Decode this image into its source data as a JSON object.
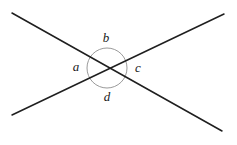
{
  "figure": {
    "name": "intersecting-lines-angle-diagram",
    "width": 237,
    "height": 145,
    "background_color": "#ffffff",
    "line_color": "#1f1f1f",
    "circle_color": "#9a9a9a",
    "label_color": "#1a1a1a",
    "line_width": 1.5,
    "circle_width": 1,
    "intersection": {
      "x": 107,
      "y": 68
    },
    "circle": {
      "cx": 107,
      "cy": 68,
      "r": 20
    },
    "lines": [
      {
        "name": "line-down-right",
        "x1": 12,
        "y1": 13,
        "x2": 222,
        "y2": 131
      },
      {
        "name": "line-up-right",
        "x1": 12,
        "y1": 115,
        "x2": 224,
        "y2": 14
      }
    ],
    "labels": [
      {
        "id": "a",
        "text": "a",
        "x": 76,
        "y": 68,
        "position": "left"
      },
      {
        "id": "b",
        "text": "b",
        "x": 106,
        "y": 39,
        "position": "top"
      },
      {
        "id": "c",
        "text": "c",
        "x": 138,
        "y": 69,
        "position": "right"
      },
      {
        "id": "d",
        "text": "d",
        "x": 107,
        "y": 98,
        "position": "bottom"
      }
    ]
  }
}
